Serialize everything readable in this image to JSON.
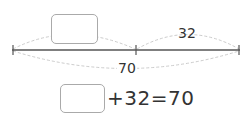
{
  "diagram": {
    "part_unknown": "",
    "part_known": "32",
    "total": "70"
  },
  "equation": {
    "blank": "",
    "text": "+32=70"
  }
}
